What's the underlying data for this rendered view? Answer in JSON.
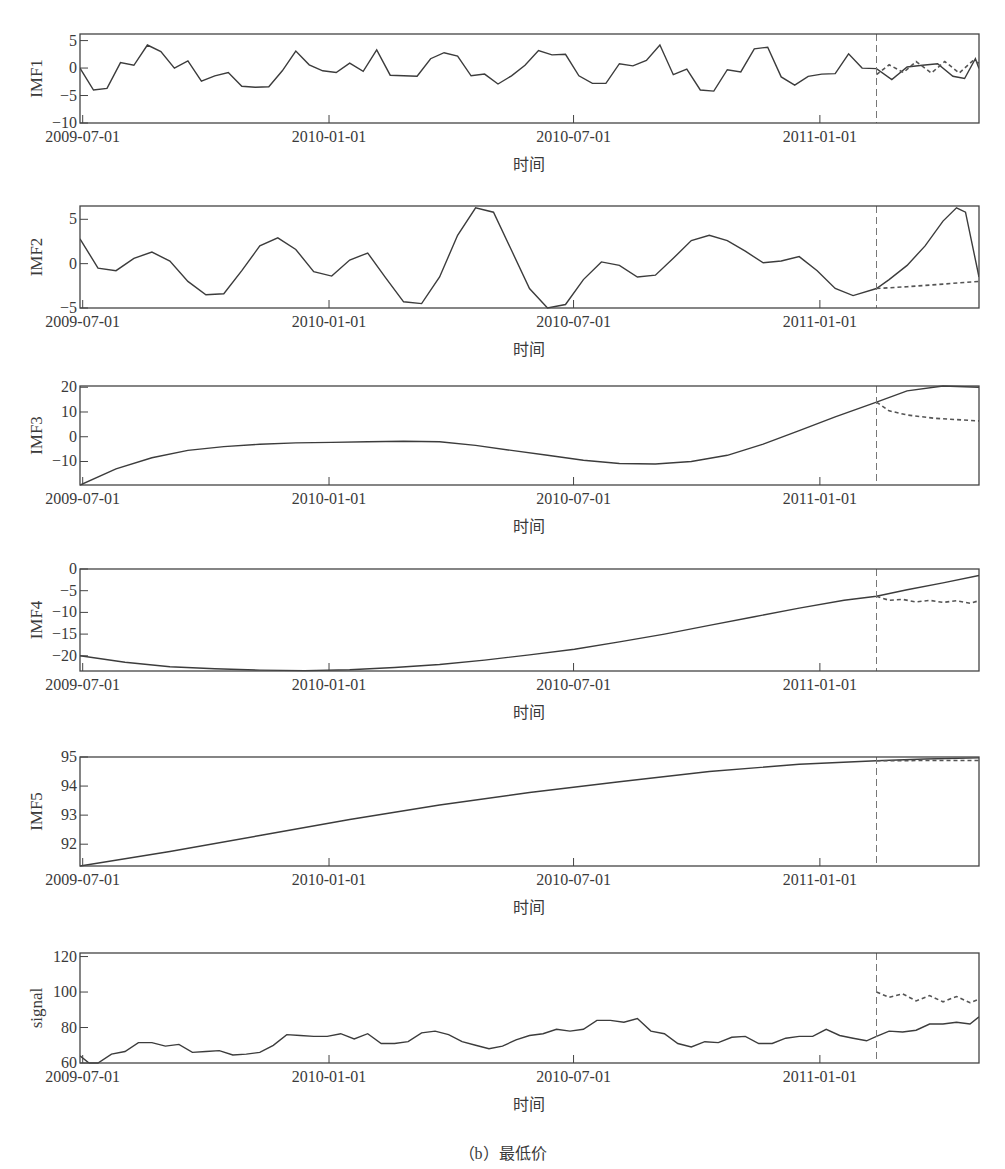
{
  "figure": {
    "caption": "（b）最低价",
    "x_axis_label": "时间",
    "x_ticks": [
      {
        "label": "2009-07-01",
        "t": 0.3
      },
      {
        "label": "2010-01-01",
        "t": 27.7
      },
      {
        "label": "2010-07-01",
        "t": 54.9
      },
      {
        "label": "2011-01-01",
        "t": 82.3
      }
    ],
    "forecast_start_t": 88.6,
    "colors": {
      "line": "#3c3c3c",
      "axis": "#444444",
      "forecast": "#555555",
      "divider": "#777777"
    }
  },
  "chart_data": [
    {
      "type": "line",
      "title": "",
      "ylabel": "IMF1",
      "xlabel": "时间",
      "ylim": [
        -10,
        6.2
      ],
      "yticks": [
        5,
        0,
        -5,
        -10
      ],
      "grid": false,
      "box": {
        "top": 34,
        "bottom": 123
      },
      "series": [
        {
          "name": "actual",
          "style": "solid",
          "t": [
            0,
            1.5,
            3,
            4.5,
            6,
            7.5,
            9,
            10.5,
            12,
            13.5,
            15,
            16.5,
            18,
            19.5,
            21,
            22.5,
            24,
            25.5,
            27,
            28.5,
            30,
            31.5,
            33,
            34.5,
            36,
            37.5,
            39,
            40.5,
            42,
            43.5,
            45,
            46.5,
            48,
            49.5,
            51,
            52.5,
            54,
            55.5,
            57,
            58.5,
            60,
            61.5,
            63,
            64.5,
            66,
            67.5,
            69,
            70.5,
            72,
            73.5,
            75,
            76.5,
            78,
            79.5,
            81,
            82.5,
            84,
            85.5,
            87,
            88.6,
            90.3,
            92,
            93.7,
            95.4,
            97.1,
            98.4,
            99.6,
            100
          ],
          "y": [
            0,
            -4,
            -3.7,
            1,
            0.5,
            4.2,
            3,
            0,
            1.3,
            -2.4,
            -1.4,
            -0.8,
            -3.3,
            -3.5,
            -3.4,
            -0.5,
            3.1,
            0.6,
            -0.5,
            -0.8,
            0.9,
            -0.6,
            3.3,
            -1.3,
            -1.4,
            -1.5,
            1.7,
            2.8,
            2.2,
            -1.4,
            -1.1,
            -2.9,
            -1.4,
            0.5,
            3.2,
            2.4,
            2.5,
            -1.4,
            -2.8,
            -2.8,
            0.8,
            0.4,
            1.4,
            4.2,
            -1.2,
            -0.2,
            -4,
            -4.2,
            -0.3,
            -0.7,
            3.5,
            3.8,
            -1.6,
            -3.1,
            -1.5,
            -1.1,
            -1,
            2.6,
            0,
            -0.1,
            -2.1,
            0.2,
            0.5,
            0.8,
            -1.5,
            -1.9,
            1.7,
            -0.1,
            -1.6,
            2.3,
            0.3,
            -0.5,
            -0.3,
            0.8,
            -1.4,
            1.1,
            -2,
            -1.2,
            -1.2,
            4.6,
            3.6,
            -3.7,
            1.2,
            -2.8,
            1.2,
            -0.3,
            -0.3,
            6.2,
            -8
          ]
        },
        {
          "name": "forecast",
          "style": "dashed",
          "t": [
            88.6,
            90,
            91.6,
            93,
            94.7,
            96.2,
            97.8,
            99.3,
            100
          ],
          "y": [
            -1.2,
            0.6,
            -0.8,
            1.2,
            -0.9,
            1.2,
            -0.9,
            1.3,
            0.9
          ]
        }
      ]
    },
    {
      "type": "line",
      "title": "",
      "ylabel": "IMF2",
      "xlabel": "时间",
      "ylim": [
        -5,
        6.5
      ],
      "yticks": [
        5,
        0,
        -5
      ],
      "grid": false,
      "box": {
        "top": 206,
        "bottom": 308
      },
      "series": [
        {
          "name": "actual",
          "style": "solid",
          "t": [
            0,
            2,
            4,
            6,
            8,
            10,
            12,
            14,
            16,
            18,
            20,
            22,
            24,
            26,
            28,
            30,
            32,
            34,
            36,
            38,
            40,
            42,
            44,
            46,
            48,
            50,
            52,
            54,
            56,
            58,
            60,
            62,
            64,
            66,
            68,
            70,
            72,
            74,
            76,
            78,
            80,
            82,
            84,
            86,
            88.6,
            90,
            92,
            94,
            96,
            97.5,
            98.5,
            100
          ],
          "y": [
            2.8,
            -0.5,
            -0.8,
            0.6,
            1.3,
            0.3,
            -2,
            -3.5,
            -3.4,
            -0.8,
            2,
            2.9,
            1.6,
            -0.9,
            -1.4,
            0.4,
            1.2,
            -1.6,
            -4.3,
            -4.5,
            -1.5,
            3.2,
            6.3,
            5.8,
            1.5,
            -2.8,
            -5,
            -4.6,
            -1.8,
            0.2,
            -0.2,
            -1.5,
            -1.3,
            0.6,
            2.6,
            3.2,
            2.6,
            1.4,
            0.1,
            0.3,
            0.8,
            -0.8,
            -2.8,
            -3.6,
            -2.8,
            -1.8,
            -0.2,
            2,
            4.8,
            6.3,
            5.8,
            -1.5
          ]
        },
        {
          "name": "forecast",
          "style": "dashed",
          "t": [
            88.6,
            92,
            96,
            100
          ],
          "y": [
            -2.8,
            -2.6,
            -2.3,
            -2
          ]
        }
      ]
    },
    {
      "type": "line",
      "title": "",
      "ylabel": "IMF3",
      "xlabel": "时间",
      "ylim": [
        -19.5,
        20.5
      ],
      "yticks": [
        20,
        10,
        0,
        -10
      ],
      "grid": false,
      "box": {
        "top": 386,
        "bottom": 485
      },
      "series": [
        {
          "name": "actual",
          "style": "solid",
          "t": [
            0,
            4,
            8,
            12,
            16,
            20,
            24,
            28,
            32,
            36,
            40,
            44,
            48,
            52,
            56,
            60,
            64,
            68,
            72,
            76,
            80,
            84,
            88.6,
            92,
            96,
            100
          ],
          "y": [
            -19.5,
            -13,
            -8.5,
            -5.5,
            -4,
            -3,
            -2.5,
            -2.3,
            -2,
            -1.8,
            -2,
            -3.5,
            -5.5,
            -7.5,
            -9.5,
            -10.8,
            -11,
            -10,
            -7.5,
            -3,
            2.5,
            8,
            14,
            18.5,
            20.5,
            20
          ]
        },
        {
          "name": "forecast",
          "style": "dashed",
          "t": [
            88.6,
            90,
            92,
            95,
            98,
            100
          ],
          "y": [
            14,
            10.5,
            8.8,
            7.5,
            6.8,
            6.4
          ]
        }
      ]
    },
    {
      "type": "line",
      "title": "",
      "ylabel": "IMF4",
      "xlabel": "时间",
      "ylim": [
        -23.5,
        0
      ],
      "yticks": [
        0,
        -5,
        -10,
        -15,
        -20
      ],
      "grid": false,
      "box": {
        "top": 569,
        "bottom": 671
      },
      "series": [
        {
          "name": "actual",
          "style": "solid",
          "t": [
            0,
            5,
            10,
            15,
            20,
            25,
            30,
            35,
            40,
            45,
            50,
            55,
            60,
            65,
            70,
            75,
            80,
            85,
            88.6,
            92,
            96,
            100
          ],
          "y": [
            -20,
            -21.5,
            -22.5,
            -23,
            -23.3,
            -23.4,
            -23.2,
            -22.7,
            -22,
            -21,
            -19.8,
            -18.5,
            -16.8,
            -15,
            -13,
            -11,
            -9,
            -7.2,
            -6.3,
            -4.8,
            -3.2,
            -1.5
          ]
        },
        {
          "name": "forecast",
          "style": "dashed",
          "t": [
            88.6,
            90,
            91.5,
            93,
            94.5,
            96,
            97.5,
            99,
            100
          ],
          "y": [
            -6.3,
            -7.2,
            -7,
            -7.6,
            -7.2,
            -7.7,
            -7.3,
            -7.9,
            -7.3
          ]
        }
      ]
    },
    {
      "type": "line",
      "title": "",
      "ylabel": "IMF5",
      "xlabel": "时间",
      "ylim": [
        91.25,
        95
      ],
      "yticks": [
        95,
        94,
        93,
        92
      ],
      "grid": false,
      "box": {
        "top": 757,
        "bottom": 866
      },
      "series": [
        {
          "name": "actual",
          "style": "solid",
          "t": [
            0,
            10,
            20,
            30,
            40,
            50,
            60,
            70,
            80,
            88.6,
            94,
            100
          ],
          "y": [
            91.25,
            91.75,
            92.3,
            92.85,
            93.35,
            93.78,
            94.15,
            94.5,
            94.75,
            94.87,
            94.93,
            94.97
          ]
        },
        {
          "name": "forecast",
          "style": "dashed",
          "t": [
            88.6,
            94,
            100
          ],
          "y": [
            94.87,
            94.88,
            94.88
          ]
        }
      ]
    },
    {
      "type": "line",
      "title": "",
      "ylabel": "signal",
      "xlabel": "时间",
      "ylim": [
        60,
        122
      ],
      "yticks": [
        120,
        100,
        80,
        60
      ],
      "grid": false,
      "box": {
        "top": 953,
        "bottom": 1063
      },
      "series": [
        {
          "name": "actual",
          "style": "solid",
          "t": [
            0,
            1,
            2,
            3.5,
            5,
            6.5,
            8,
            9.5,
            11,
            12.5,
            14,
            15.5,
            17,
            18.5,
            20,
            21.5,
            23,
            24.5,
            26,
            27.5,
            29,
            30.5,
            32,
            33.5,
            35,
            36.5,
            38,
            39.5,
            41,
            42.5,
            44,
            45.5,
            47,
            48.5,
            50,
            51.5,
            53,
            54.5,
            56,
            57.5,
            59,
            60.5,
            62,
            63.5,
            65,
            66.5,
            68,
            69.5,
            71,
            72.5,
            74,
            75.5,
            77,
            78.5,
            80,
            81.5,
            83,
            84.5,
            86,
            87.5,
            88.6,
            90,
            91.5,
            93,
            94.5,
            96,
            97.5,
            99,
            100
          ],
          "y": [
            64,
            60,
            60,
            65,
            66.5,
            71.5,
            71.5,
            69.5,
            70.5,
            66,
            66.5,
            67,
            64.5,
            65,
            66,
            70,
            76,
            75.5,
            75,
            75,
            76.5,
            73.5,
            76.5,
            71,
            71,
            72,
            77,
            78,
            76,
            72,
            70,
            68,
            69.5,
            73,
            75.5,
            76.5,
            79,
            78,
            79,
            84,
            84,
            83,
            85,
            78,
            76.5,
            71,
            69,
            72,
            71.5,
            74.5,
            75,
            71,
            71,
            74,
            75,
            75,
            79,
            75.5,
            74,
            72.5,
            75,
            78,
            77.5,
            78.5,
            82,
            82,
            83,
            82,
            86,
            85.5,
            90,
            91.5,
            92,
            93.5,
            95,
            98,
            97.5,
            100,
            102,
            110,
            111,
            106,
            112,
            112,
            117,
            119,
            118,
            122,
            105
          ]
        },
        {
          "name": "forecast",
          "style": "dashed",
          "t": [
            88.6,
            90,
            91.5,
            93,
            94.5,
            96,
            97.5,
            99,
            100
          ],
          "y": [
            100,
            97,
            99,
            95,
            98,
            94.5,
            97.5,
            94,
            96
          ]
        }
      ]
    }
  ]
}
